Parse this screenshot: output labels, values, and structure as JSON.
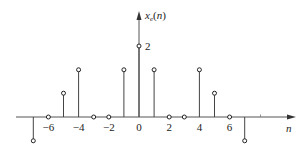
{
  "chart_data": {
    "type": "stem",
    "title": "",
    "xlabel": "n",
    "ylabel": "x_e(n)",
    "ylabel_main": "x",
    "ylabel_sub": "e",
    "ylabel_arg": "(n)",
    "x": [
      -7,
      -6,
      -5,
      -4,
      -3,
      -2,
      -1,
      0,
      1,
      2,
      3,
      4,
      5,
      6,
      7
    ],
    "values": [
      -0.67,
      0,
      0.67,
      1.33,
      0,
      0,
      1.33,
      2,
      1.33,
      0,
      0,
      1.33,
      0.67,
      0,
      -0.67
    ],
    "x_tick_labels": [
      {
        "n": -6,
        "label": "−6"
      },
      {
        "n": -4,
        "label": "−4"
      },
      {
        "n": -2,
        "label": "−2"
      },
      {
        "n": 0,
        "label": "0"
      },
      {
        "n": 2,
        "label": "2"
      },
      {
        "n": 4,
        "label": "4"
      },
      {
        "n": 6,
        "label": "6"
      }
    ],
    "annotations": [
      {
        "n": 0,
        "value": 2,
        "label": "2"
      }
    ],
    "xlim": [
      -8,
      10
    ],
    "ylim": [
      -1,
      3
    ],
    "grid": false,
    "legend": null
  }
}
